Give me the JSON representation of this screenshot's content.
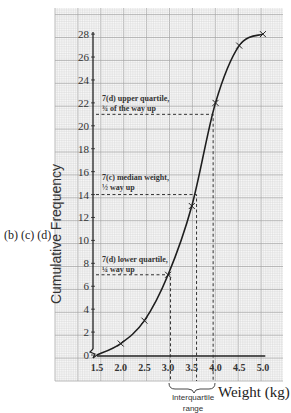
{
  "chart_data": {
    "type": "line",
    "title": "",
    "xlabel": "Weight (kg)",
    "ylabel": "Cumulative Frequency",
    "x": [
      1.5,
      2.0,
      2.5,
      3.0,
      3.5,
      4.0,
      4.5,
      5.0
    ],
    "series": [
      {
        "name": "Cumulative frequency",
        "values": [
          0,
          1,
          3,
          7,
          13,
          22,
          27,
          28
        ]
      }
    ],
    "xticks": [
      "1.5",
      "2.0",
      "2.5",
      "3.0",
      "3.5",
      "4.0",
      "4.5",
      "5.0"
    ],
    "yticks": [
      0,
      2,
      4,
      6,
      8,
      10,
      12,
      14,
      16,
      18,
      20,
      22,
      24,
      26,
      28
    ],
    "xlim": [
      1.5,
      5.0
    ],
    "ylim": [
      0,
      28
    ],
    "grid": true,
    "axis_break": "x-axis starts at 1.5 (zigzag break near origin)",
    "reference_lines": [
      {
        "label": "7(d) lower quartile, ¼ way up",
        "y": 7,
        "x": 3.05
      },
      {
        "label": "7(c) median weight, ½ way up",
        "y": 14,
        "x": 3.6
      },
      {
        "label": "7(d) upper quartile, ¾ of the way up",
        "y": 21,
        "x": 3.95
      }
    ],
    "annotations": [
      {
        "text": "7(d) upper quartile,",
        "line2": "¾ of the way up"
      },
      {
        "text": "7(c) median weight,",
        "line2": "½ way up"
      },
      {
        "text": "7(d) lower quartile,",
        "line2": "¼ way up"
      },
      {
        "text": "Interquartile range",
        "note": "brace spanning x = 3.05 to 3.95"
      }
    ]
  },
  "labels": {
    "side": "(b) (c) (d)",
    "ylabel": "Cumulative Frequency",
    "xlabel": "Weight (kg)",
    "iqr_line1": "Interquartile",
    "iqr_line2": "range",
    "upper_1": "7(d) upper quartile,",
    "upper_2": "¾ of the way up",
    "median_1": "7(c) median weight,",
    "median_2": "½ way up",
    "lower_1": "7(d) lower quartile,",
    "lower_2": "¼ way up"
  },
  "colors": {
    "grid_minor": "#d4d4d4",
    "grid_major": "#a8a8a8",
    "curve": "#1e1e1e",
    "dash": "#333333"
  }
}
